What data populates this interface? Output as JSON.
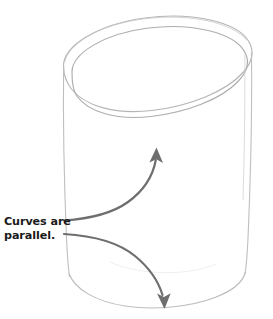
{
  "figure": {
    "background_color": "#ffffff",
    "annotation": {
      "label_line_1": "Curves are",
      "label_line_2": "parallel.",
      "label_color": "#1b1b1b",
      "arrow_color": "#6e6e6e",
      "arrow_count": 2,
      "arrow_up_target": "top-ellipse-front-arc",
      "arrow_down_target": "bottom-arc"
    },
    "drawing": {
      "subject": "cylinder",
      "line_color": "#b9b9b9",
      "line_color_dark": "#9e9e9e",
      "parts": [
        "top-outer-ellipse",
        "top-inner-ellipse",
        "left-side-line",
        "right-side-line",
        "bottom-arc"
      ]
    }
  }
}
